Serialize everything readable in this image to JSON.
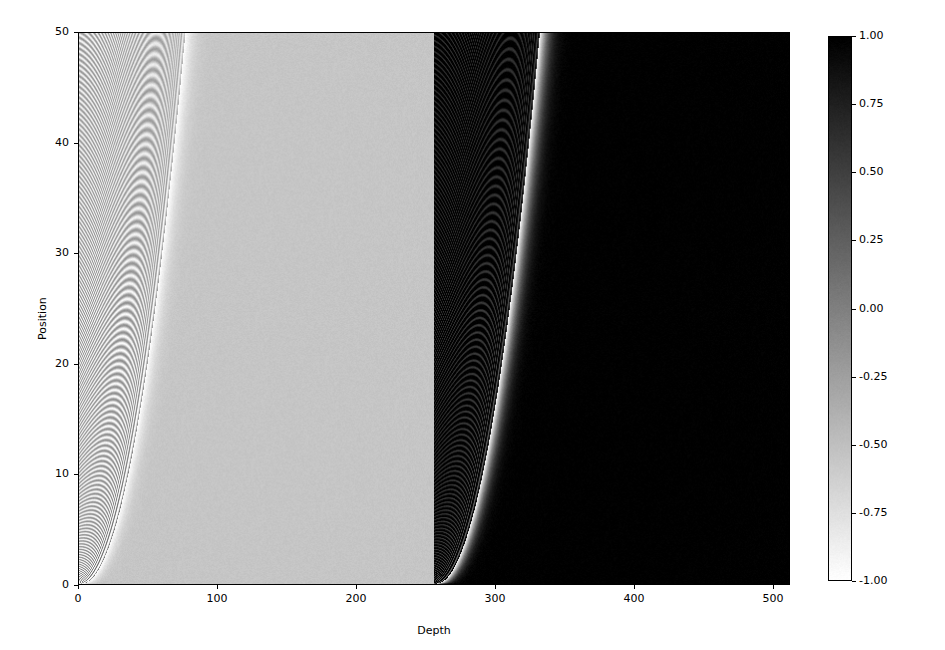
{
  "figure": {
    "background": "#ffffff",
    "width": 945,
    "height": 650
  },
  "axis": {
    "xlabel": "Depth",
    "ylabel": "Position",
    "x_ticks": [
      "0",
      "100",
      "200",
      "300",
      "400",
      "500"
    ],
    "y_ticks": [
      "0",
      "10",
      "20",
      "30",
      "40",
      "50"
    ]
  },
  "colorbar": {
    "ticks": [
      "1.00",
      "0.75",
      "0.50",
      "0.25",
      "0.00",
      "-0.25",
      "-0.50",
      "-0.75",
      "-1.00"
    ],
    "vmin": -1.0,
    "vmax": 1.0,
    "orientation": "vertical",
    "colormap": "gray_r",
    "low_color": "#ffffff",
    "high_color": "#000000"
  },
  "chart_data": {
    "type": "heatmap",
    "title": "",
    "xlabel": "Depth",
    "ylabel": "Position",
    "xlim": [
      0,
      512
    ],
    "ylim": [
      0,
      50
    ],
    "xticks": [
      0,
      100,
      200,
      300,
      400,
      500
    ],
    "yticks": [
      0,
      10,
      20,
      30,
      40,
      50
    ],
    "grid": false,
    "colormap": "gray_r",
    "colorbar_label": "",
    "zlim": [
      -1.0,
      1.0
    ],
    "zticks": [
      1.0,
      0.75,
      0.5,
      0.25,
      0.0,
      -0.25,
      -0.5,
      -0.75,
      -1.0
    ],
    "legend_position": "right-colorbar",
    "nx": 512,
    "ny": 256,
    "regions": [
      {
        "name": "left-panel",
        "depth_range": [
          0,
          256
        ],
        "background_value": -0.55,
        "background_hex": "#c6c6c6",
        "caustic_turning_depth_at_position0": 34,
        "fringe_envelope_decay_depth": 78
      },
      {
        "name": "right-panel",
        "depth_range": [
          256,
          512
        ],
        "background_value": 1.0,
        "background_hex": "#0a0a0a",
        "caustic_turning_depth_at_position0": 290,
        "fringe_envelope_decay_depth": 120
      }
    ],
    "noise_amplitude": 0.035,
    "series": [
      {
        "name": "field-amplitude",
        "model": "damped chirped cosine with parabolic caustic",
        "value_range": [
          -1.0,
          1.0
        ]
      }
    ]
  }
}
